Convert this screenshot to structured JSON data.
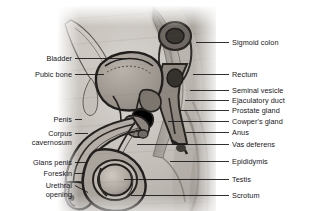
{
  "figure": {
    "type": "anatomical-illustration",
    "text_color": "#17171a",
    "leader_color": "#1a1a1a",
    "background_color": "#ffffff",
    "illustration_tone": "grayscale halftone"
  },
  "labels_left": [
    {
      "name": "bladder",
      "lines": [
        "Bladder"
      ],
      "text_right": 72,
      "text_top": 54,
      "leader": {
        "x1": 75,
        "y1": 58.5,
        "x2": 130,
        "y2": 58.5
      }
    },
    {
      "name": "pubic-bone",
      "lines": [
        "Pubic bone"
      ],
      "text_right": 72,
      "text_top": 70,
      "leader": {
        "x1": 75,
        "y1": 74.5,
        "x2": 104,
        "y2": 74.5
      }
    },
    {
      "name": "penis",
      "lines": [
        "Penis"
      ],
      "text_right": 72,
      "text_top": 115,
      "leader": {
        "x1": 75,
        "y1": 119.5,
        "x2": 82,
        "y2": 119.5
      }
    },
    {
      "name": "corpus-cavernosum",
      "lines": [
        "Corpus",
        "cavernosum"
      ],
      "text_right": 72,
      "text_top": 129,
      "leader": {
        "x1": 75,
        "y1": 133.5,
        "x2": 88,
        "y2": 133.5
      }
    },
    {
      "name": "glans-penis",
      "lines": [
        "Glans penis"
      ],
      "text_right": 72,
      "text_top": 158,
      "leader": {
        "x1": 75,
        "y1": 162.5,
        "x2": 87,
        "y2": 162.5
      }
    },
    {
      "name": "foreskin",
      "lines": [
        "Foreskin"
      ],
      "text_right": 72,
      "text_top": 169,
      "leader": {
        "x1": 75,
        "y1": 173.5,
        "x2": 84,
        "y2": 173.5
      }
    },
    {
      "name": "urethral-opening",
      "lines": [
        "Urethral",
        "opening"
      ],
      "text_right": 72,
      "text_top": 181,
      "leader": {
        "x1": 75,
        "y1": 185.5,
        "x2": 88,
        "y2": 192.5
      }
    }
  ],
  "labels_right": [
    {
      "name": "sigmoid-colon",
      "lines": [
        "Sigmoid colon"
      ],
      "text_left": 232,
      "text_top": 38,
      "leader": {
        "x1": 196,
        "y1": 42.5,
        "x2": 229,
        "y2": 42.5
      }
    },
    {
      "name": "rectum",
      "lines": [
        "Rectum"
      ],
      "text_left": 232,
      "text_top": 70,
      "leader": {
        "x1": 193,
        "y1": 74.5,
        "x2": 229,
        "y2": 74.5
      }
    },
    {
      "name": "seminal-vesicle",
      "lines": [
        "Seminal vesicle"
      ],
      "text_left": 232,
      "text_top": 86,
      "leader": {
        "x1": 190,
        "y1": 90.5,
        "x2": 229,
        "y2": 90.5
      }
    },
    {
      "name": "ejaculatory-duct",
      "lines": [
        "Ejaculatory duct"
      ],
      "text_left": 232,
      "text_top": 96,
      "leader": {
        "x1": 185,
        "y1": 100.5,
        "x2": 229,
        "y2": 100.5
      }
    },
    {
      "name": "prostate-gland",
      "lines": [
        "Prostate gland"
      ],
      "text_left": 232,
      "text_top": 106,
      "leader": {
        "x1": 180,
        "y1": 110.5,
        "x2": 229,
        "y2": 110.5
      }
    },
    {
      "name": "cowpers-gland",
      "lines": [
        "Cowper's gland"
      ],
      "text_left": 232,
      "text_top": 117,
      "leader": {
        "x1": 168,
        "y1": 121.5,
        "x2": 229,
        "y2": 121.5
      }
    },
    {
      "name": "anus",
      "lines": [
        "Anus"
      ],
      "text_left": 232,
      "text_top": 128,
      "leader": {
        "x1": 186,
        "y1": 132.5,
        "x2": 229,
        "y2": 132.5
      }
    },
    {
      "name": "vas-deferens",
      "lines": [
        "Vas deferens"
      ],
      "text_left": 232,
      "text_top": 140,
      "leader": {
        "x1": 137,
        "y1": 144.5,
        "x2": 229,
        "y2": 144.5
      }
    },
    {
      "name": "epididymis",
      "lines": [
        "Epididymis"
      ],
      "text_left": 232,
      "text_top": 157,
      "leader": {
        "x1": 170,
        "y1": 161.5,
        "x2": 229,
        "y2": 161.5
      }
    },
    {
      "name": "testis",
      "lines": [
        "Testis"
      ],
      "text_left": 232,
      "text_top": 175,
      "leader": {
        "x1": 124,
        "y1": 179.5,
        "x2": 229,
        "y2": 179.5
      }
    },
    {
      "name": "scrotum",
      "lines": [
        "Scrotum"
      ],
      "text_left": 232,
      "text_top": 191,
      "leader": {
        "x1": 131,
        "y1": 195.5,
        "x2": 229,
        "y2": 195.5
      }
    }
  ]
}
